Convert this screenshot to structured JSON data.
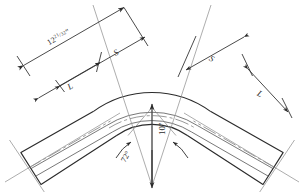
{
  "drawing": {
    "title": "Pipe Bend Elbow Layout",
    "type": "engineering-line-drawing",
    "background_color": "#ffffff",
    "line_color": "#2b2b2b",
    "thin_line_color": "#6e6e6e"
  },
  "labels": {
    "overall_length": "12",
    "overall_fraction_num": "21",
    "overall_fraction_den": "32",
    "overall_unit": "\"",
    "segment_left": "S",
    "segment_right": "S",
    "leg_left": "L",
    "leg_right": "L",
    "angle": "72°",
    "radius": "10\""
  },
  "dimensions": {
    "overall_value": "12 21/32\"",
    "bend_angle_deg": 72,
    "bend_radius_in": 10,
    "segment_label": "S",
    "leg_label": "L"
  },
  "geometry": {
    "arc_center": {
      "x": 152,
      "y": 186
    },
    "outer_radius": 100,
    "inner_radius": 62,
    "mid_radius_1": 84,
    "mid_radius_2": 74,
    "half_angle_deg": 36
  }
}
